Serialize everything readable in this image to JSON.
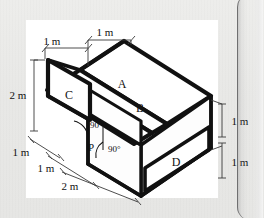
{
  "figure": {
    "type": "isometric-engineering-drawing",
    "face_labels": [
      {
        "id": "A",
        "text": "A"
      },
      {
        "id": "B",
        "text": "B"
      },
      {
        "id": "C",
        "text": "C"
      },
      {
        "id": "D",
        "text": "D"
      }
    ],
    "point_labels": [
      {
        "id": "P",
        "text": "P"
      }
    ],
    "angle_labels": [
      {
        "id": "angle-left",
        "text": "90°"
      },
      {
        "id": "angle-right",
        "text": "90°"
      }
    ],
    "dimensions": {
      "top_left": "1 m",
      "top_right": "1 m",
      "left_vertical": "2 m",
      "left_depth": "1 m",
      "bottom_first": "1 m",
      "bottom_second": "2 m",
      "right_upper": "1 m",
      "right_lower": "1 m"
    },
    "colors": {
      "page_background": "#e9e9e7",
      "panel_background": "#ffffff",
      "ink": "#111111",
      "hidden_line": "#9a9a9a",
      "dimension_line": "#3a3a3a",
      "page_edge": "#6f6f70"
    }
  }
}
